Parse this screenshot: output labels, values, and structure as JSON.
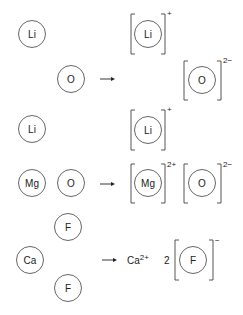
{
  "reactions": [
    {
      "name": "lithium-oxide",
      "reactants": [
        {
          "symbol": "Li",
          "cx": 32,
          "cy": 34
        },
        {
          "symbol": "O",
          "cx": 71,
          "cy": 79
        },
        {
          "symbol": "Li",
          "cx": 32,
          "cy": 129
        }
      ],
      "arrow": {
        "x1": 100,
        "x2": 115,
        "y": 79
      },
      "products": [
        {
          "symbol": "Li",
          "charge": "+",
          "cx": 148,
          "cy": 34,
          "bx1": 131,
          "bx2": 165,
          "by1": 14,
          "by2": 54,
          "chx": 167,
          "chy": 16
        },
        {
          "symbol": "O",
          "charge": "2−",
          "cx": 202,
          "cy": 80,
          "bx1": 184,
          "bx2": 221,
          "by1": 61,
          "by2": 100,
          "chx": 223,
          "chy": 63
        },
        {
          "symbol": "Li",
          "charge": "+",
          "cx": 148,
          "cy": 130,
          "bx1": 131,
          "bx2": 165,
          "by1": 110,
          "by2": 150,
          "chx": 167,
          "chy": 112
        }
      ]
    },
    {
      "name": "magnesium-oxide",
      "reactants": [
        {
          "symbol": "Mg",
          "cx": 32,
          "cy": 183
        },
        {
          "symbol": "O",
          "cx": 71,
          "cy": 183
        }
      ],
      "arrow": {
        "x1": 100,
        "x2": 115,
        "y": 184
      },
      "products": [
        {
          "symbol": "Mg",
          "charge": "2+",
          "cx": 148,
          "cy": 183,
          "bx1": 131,
          "bx2": 165,
          "by1": 164,
          "by2": 203,
          "chx": 167,
          "chy": 167
        },
        {
          "symbol": "O",
          "charge": "2−",
          "cx": 202,
          "cy": 183,
          "bx1": 184,
          "bx2": 221,
          "by1": 164,
          "by2": 203,
          "chx": 223,
          "chy": 167
        }
      ]
    },
    {
      "name": "calcium-fluoride",
      "reactants": [
        {
          "symbol": "F",
          "cx": 68,
          "cy": 227
        },
        {
          "symbol": "Ca",
          "cx": 30,
          "cy": 260
        },
        {
          "symbol": "F",
          "cx": 68,
          "cy": 288
        }
      ],
      "arrow": {
        "x1": 102,
        "x2": 117,
        "y": 260
      },
      "free_ion": {
        "symbol": "Ca",
        "charge": "2+",
        "x": 127,
        "y": 264
      },
      "coefficient": {
        "value": "2",
        "x": 164,
        "y": 264
      },
      "products": [
        {
          "symbol": "F",
          "charge": "−",
          "cx": 193,
          "cy": 260,
          "bx1": 175,
          "bx2": 213,
          "by1": 240,
          "by2": 280,
          "chx": 215,
          "chy": 243
        }
      ]
    }
  ],
  "style": {
    "radius": 13.5,
    "text_color": "#222222",
    "stroke_color": "#555555"
  }
}
